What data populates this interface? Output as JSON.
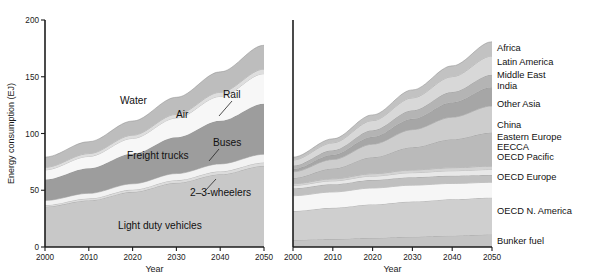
{
  "figure": {
    "background": "#ffffff",
    "width": 594,
    "height": 280
  },
  "left_panel": {
    "y_axis_title": "Energy consumption (EJ)",
    "x_axis_title": "Year",
    "y_ticks": [
      "0",
      "50",
      "100",
      "150",
      "200"
    ],
    "x_ticks": [
      "2000",
      "2010",
      "2020",
      "2030",
      "2040",
      "2050"
    ],
    "inline_labels": [
      {
        "name": "water",
        "text": "Water",
        "x": 120,
        "y": 104
      },
      {
        "name": "air",
        "text": "Air",
        "x": 176,
        "y": 118
      },
      {
        "name": "rail",
        "text": "Rail",
        "x": 223,
        "y": 98
      },
      {
        "name": "freight-trucks",
        "text": "Freight trucks",
        "x": 127,
        "y": 159
      },
      {
        "name": "buses",
        "text": "Buses",
        "x": 213,
        "y": 146
      },
      {
        "name": "two-three-wheelers",
        "text": "2–3-wheelers",
        "x": 190,
        "y": 196
      },
      {
        "name": "light-duty-vehicles",
        "text": "Light duty vehicles",
        "x": 118,
        "y": 229
      }
    ]
  },
  "right_panel": {
    "x_axis_title": "Year",
    "x_ticks": [
      "2000",
      "2010",
      "2020",
      "2030",
      "2040",
      "2050"
    ],
    "legend": [
      {
        "name": "africa",
        "text": "Africa",
        "y": 51
      },
      {
        "name": "latin-america",
        "text": "Latin America",
        "y": 65
      },
      {
        "name": "middle-east",
        "text": "Middle East",
        "y": 78
      },
      {
        "name": "india",
        "text": "India",
        "y": 89
      },
      {
        "name": "other-asia",
        "text": "Other Asia",
        "y": 107
      },
      {
        "name": "china",
        "text": "China",
        "y": 128
      },
      {
        "name": "eastern-europe",
        "text": "Eastern Europe",
        "y": 140
      },
      {
        "name": "eecca",
        "text": "EECCA",
        "y": 150
      },
      {
        "name": "oecd-pacific",
        "text": "OECD Pacific",
        "y": 160
      },
      {
        "name": "oecd-europe",
        "text": "OECD Europe",
        "y": 180
      },
      {
        "name": "oecd-north-america",
        "text": "OECD N. America",
        "y": 214
      },
      {
        "name": "bunker-fuel",
        "text": "Bunker fuel",
        "y": 244
      }
    ]
  },
  "chart_data": [
    {
      "id": "transport-mode",
      "type": "area",
      "stacked": true,
      "title": "",
      "xlabel": "Year",
      "ylabel": "Energy consumption (EJ)",
      "xlim": [
        2000,
        2050
      ],
      "ylim": [
        0,
        200
      ],
      "grid": false,
      "legend_position": "inline-annotations",
      "x": [
        2000,
        2010,
        2020,
        2030,
        2040,
        2050
      ],
      "series": [
        {
          "name": "Light duty vehicles",
          "color": "#c8c8c8",
          "values": [
            35.5,
            41.0,
            48.5,
            56.5,
            64.0,
            71.5
          ]
        },
        {
          "name": "2–3-wheelers",
          "color": "#dcdcdc",
          "values": [
            1.4,
            1.7,
            2.0,
            2.3,
            2.6,
            2.9
          ]
        },
        {
          "name": "Buses",
          "color": "#f2f2f2",
          "values": [
            4.1,
            4.6,
            5.2,
            5.9,
            6.6,
            7.3
          ]
        },
        {
          "name": "Freight trucks",
          "color": "#9d9d9d",
          "values": [
            18.5,
            22.0,
            26.5,
            32.0,
            38.0,
            44.5
          ]
        },
        {
          "name": "Air",
          "color": "#f7f7f7",
          "values": [
            8.5,
            10.5,
            13.5,
            17.0,
            21.5,
            26.5
          ]
        },
        {
          "name": "Rail",
          "color": "#dedede",
          "values": [
            2.2,
            2.5,
            2.8,
            3.2,
            3.6,
            4.0
          ]
        },
        {
          "name": "Water",
          "color": "#bdbdbd",
          "values": [
            9.0,
            10.5,
            12.5,
            15.0,
            18.0,
            21.0
          ]
        }
      ]
    },
    {
      "id": "world-region",
      "type": "area",
      "stacked": true,
      "title": "",
      "xlabel": "Year",
      "ylabel": "",
      "xlim": [
        2000,
        2050
      ],
      "ylim": [
        0,
        200
      ],
      "grid": false,
      "legend_position": "right",
      "x": [
        2000,
        2010,
        2020,
        2030,
        2040,
        2050
      ],
      "series": [
        {
          "name": "Bunker fuel",
          "color": "#c4c4c4",
          "values": [
            6.2,
            7.0,
            8.0,
            9.0,
            10.0,
            11.0
          ]
        },
        {
          "name": "OECD N. America",
          "color": "#cfcfcf",
          "values": [
            25.5,
            27.5,
            29.5,
            31.0,
            32.0,
            32.5
          ]
        },
        {
          "name": "OECD Europe",
          "color": "#f6f6f6",
          "values": [
            13.5,
            14.0,
            14.5,
            14.5,
            14.0,
            13.5
          ]
        },
        {
          "name": "OECD Pacific",
          "color": "#c0c0c0",
          "values": [
            6.5,
            6.8,
            7.0,
            7.0,
            6.8,
            6.5
          ]
        },
        {
          "name": "EECCA",
          "color": "#e8e8e8",
          "values": [
            2.6,
            3.0,
            3.5,
            4.0,
            4.4,
            4.8
          ]
        },
        {
          "name": "Eastern Europe",
          "color": "#d3d3d3",
          "values": [
            1.5,
            1.8,
            2.1,
            2.4,
            2.7,
            3.0
          ]
        },
        {
          "name": "China",
          "color": "#bababa",
          "values": [
            5.0,
            9.0,
            14.5,
            20.0,
            25.0,
            29.5
          ]
        },
        {
          "name": "Other Asia",
          "color": "#cdcdcd",
          "values": [
            5.5,
            8.0,
            11.5,
            15.5,
            19.5,
            23.5
          ]
        },
        {
          "name": "India",
          "color": "#a6a6a6",
          "values": [
            2.4,
            4.0,
            6.5,
            9.5,
            13.0,
            16.5
          ]
        },
        {
          "name": "Middle East",
          "color": "#b4b4b4",
          "values": [
            3.0,
            4.2,
            5.8,
            7.5,
            9.2,
            11.0
          ]
        },
        {
          "name": "Latin America",
          "color": "#d8d8d8",
          "values": [
            5.0,
            6.5,
            8.5,
            11.0,
            13.5,
            16.5
          ]
        },
        {
          "name": "Africa",
          "color": "#c2c2c2",
          "values": [
            2.5,
            3.5,
            5.0,
            7.0,
            9.5,
            12.5
          ]
        }
      ]
    }
  ]
}
